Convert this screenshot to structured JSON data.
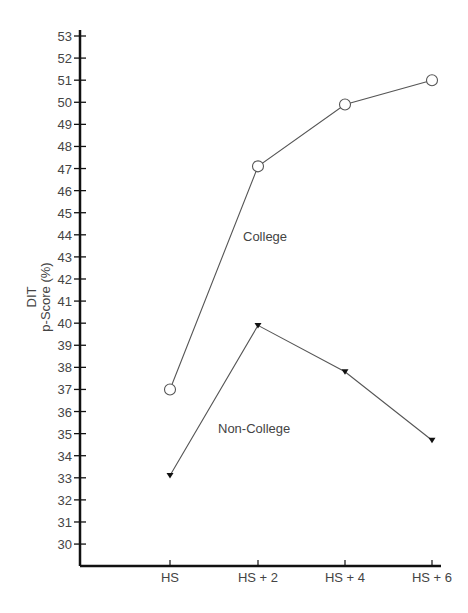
{
  "chart_data": {
    "type": "line",
    "title": "",
    "xlabel": "",
    "ylabel": "DIT p-Score (%)",
    "ylabel_lines": [
      "DIT",
      "p-Score  (%)"
    ],
    "categories": [
      "HS",
      "HS + 2",
      "HS + 4",
      "HS + 6"
    ],
    "series": [
      {
        "name": "College",
        "marker": "open-circle",
        "values": [
          37.0,
          47.1,
          49.9,
          51.0
        ]
      },
      {
        "name": "Non-College",
        "marker": "filled-triangle-down",
        "values": [
          33.1,
          39.9,
          37.8,
          34.7
        ]
      }
    ],
    "yticks": [
      30,
      31,
      32,
      33,
      34,
      35,
      36,
      37,
      38,
      39,
      40,
      41,
      42,
      43,
      44,
      45,
      46,
      47,
      48,
      49,
      50,
      51,
      52,
      53
    ],
    "ylim": [
      29,
      53
    ],
    "grid": false,
    "legend": "inline annotations",
    "annotations": [
      {
        "text": "College",
        "x": 243,
        "y": 241
      },
      {
        "text": "Non-College",
        "x": 218,
        "y": 433
      }
    ],
    "colors": {
      "axis": "#111111",
      "line": "#555555",
      "text": "#444444"
    }
  }
}
